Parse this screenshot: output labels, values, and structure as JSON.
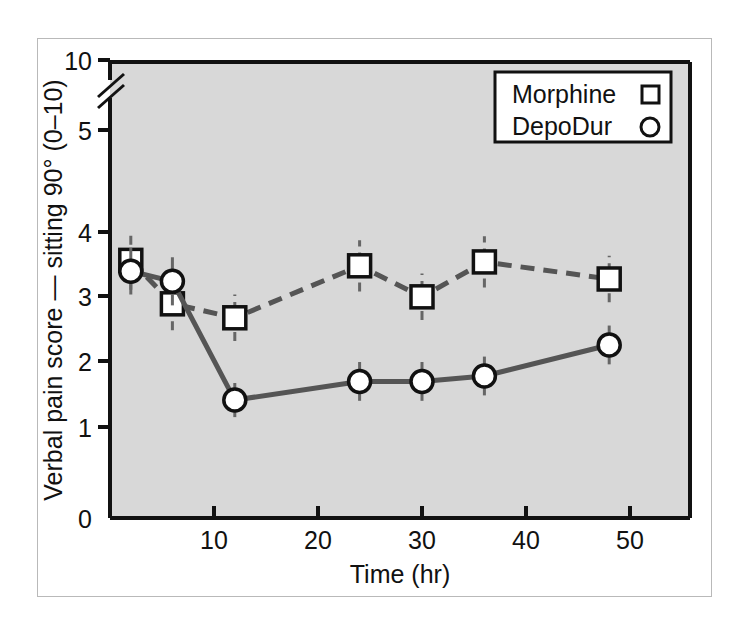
{
  "chart_data": {
    "type": "line",
    "title": "",
    "xlabel": "Time (hr)",
    "ylabel": "Verbal pain score — sitting 90° (0–10)",
    "xlim": [
      0,
      50
    ],
    "ylim": [
      0,
      5
    ],
    "axis_break": {
      "present": true,
      "between": [
        5,
        10
      ],
      "top_tick": "10"
    },
    "xticks": [
      "10",
      "20",
      "30",
      "40",
      "50"
    ],
    "xtick_values": [
      10,
      20,
      30,
      40,
      50
    ],
    "yticks": [
      "0",
      "1",
      "2",
      "3",
      "4",
      "5",
      "10"
    ],
    "ytick_values": [
      0,
      1,
      2,
      3,
      4,
      5,
      10
    ],
    "grid": false,
    "legend_position": "top-right",
    "x": [
      2,
      6,
      12,
      24,
      30,
      36,
      48
    ],
    "series": [
      {
        "name": "Morphine",
        "marker": "square",
        "linestyle": "dashed",
        "color": "#555555",
        "values": [
          3.32,
          2.76,
          2.58,
          3.25,
          2.85,
          3.3,
          3.08
        ],
        "errors": [
          0.38,
          0.34,
          0.3,
          0.33,
          0.3,
          0.33,
          0.3
        ]
      },
      {
        "name": "DepoDur",
        "marker": "circle",
        "linestyle": "solid",
        "color": "#555555",
        "values": [
          3.18,
          3.05,
          1.52,
          1.76,
          1.76,
          1.83,
          2.23
        ],
        "errors": [
          0.3,
          0.31,
          0.22,
          0.25,
          0.25,
          0.25,
          0.25
        ]
      }
    ]
  },
  "legend": {
    "entries": [
      {
        "label": "Morphine",
        "marker": "square"
      },
      {
        "label": "DepoDur",
        "marker": "circle"
      }
    ]
  },
  "colors": {
    "plot_background": "#d8d8d8",
    "axis": "#111111",
    "series_line": "#555555",
    "marker_fill": "#ffffff",
    "frame": "#b9b9b9"
  }
}
